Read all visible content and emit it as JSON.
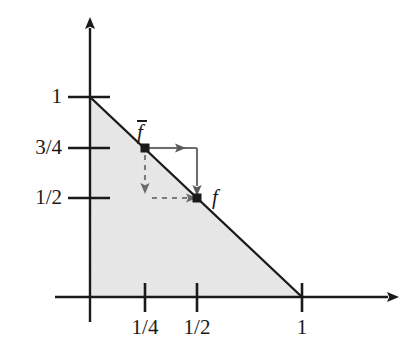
{
  "figure": {
    "type": "math-diagram",
    "background_color": "#ffffff",
    "ink_color": "#1a1a1a",
    "shade_color": "#e8e8e8",
    "arrow_color": "#595959"
  },
  "axes": {
    "x_axis": {
      "name": "x-axis",
      "ticks": [
        {
          "label": "1/4",
          "value": 0.25,
          "px": 145
        },
        {
          "label": "1/2",
          "value": 0.5,
          "px": 197
        },
        {
          "label": "1",
          "value": 1.0,
          "px": 302
        }
      ]
    },
    "y_axis": {
      "name": "y-axis",
      "ticks": [
        {
          "label": "1",
          "value": 1.0,
          "px": 97
        },
        {
          "label": "3/4",
          "value": 0.75,
          "px": 148
        },
        {
          "label": "1/2",
          "value": 0.5,
          "px": 198
        }
      ]
    }
  },
  "region": {
    "name": "shaded-simplex",
    "vertices": [
      [
        0,
        0
      ],
      [
        1,
        0
      ],
      [
        0,
        1
      ]
    ],
    "fill": "#e8e8e8"
  },
  "boundary_line": {
    "name": "simplex-hypotenuse",
    "from": [
      0,
      1
    ],
    "to": [
      1,
      0
    ]
  },
  "points": [
    {
      "id": "fbar",
      "label": "f̄",
      "label_plain": "f-bar",
      "coords": [
        0.25,
        0.75
      ],
      "label_px": [
        139,
        122
      ]
    },
    {
      "id": "f",
      "label": "f",
      "label_plain": "f",
      "coords": [
        0.5,
        0.5
      ],
      "label_px": [
        213,
        190
      ]
    }
  ],
  "arrows": {
    "solid_path": {
      "name": "solid-arrow-path",
      "style": "solid",
      "segments": [
        {
          "from": [
            0.25,
            0.75
          ],
          "to": [
            0.5,
            0.75
          ],
          "arrowhead_at_px": 180
        },
        {
          "from": [
            0.5,
            0.75
          ],
          "to": [
            0.5,
            0.5
          ],
          "arrowhead": true
        }
      ]
    },
    "dashed_path": {
      "name": "dashed-arrow-path",
      "style": "dashed",
      "segments": [
        {
          "from": [
            0.25,
            0.75
          ],
          "to": [
            0.25,
            0.5
          ],
          "arrowhead": true
        },
        {
          "from": [
            0.25,
            0.5
          ],
          "to": [
            0.5,
            0.5
          ],
          "arrowhead": true
        }
      ]
    }
  }
}
